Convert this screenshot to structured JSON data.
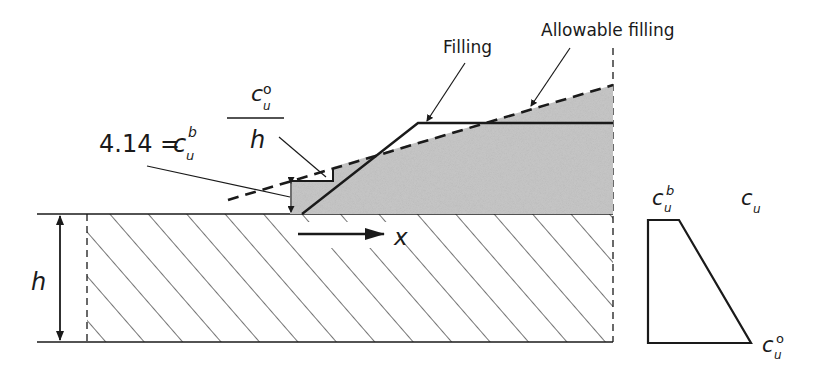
{
  "labels": {
    "filling": "Filling",
    "allowable_filling": "Allowable filling",
    "cub_eq_prefix": "4.14 = ",
    "c": "c",
    "sub_u": "u",
    "sup_b": "b",
    "sup_o": "o",
    "h": "h",
    "x": "x",
    "cu_axis": "c",
    "cu_axis_sub": "u"
  },
  "colors": {
    "line": "#1a1a1a",
    "fill_gray": "#c8c8c8",
    "hatch": "#2a2a2a",
    "background": "#ffffff"
  },
  "geometry": {
    "ground_y": 214,
    "base_y": 342,
    "left_x": 87,
    "right_x": 613,
    "allowable_line": {
      "x1": 228,
      "y1": 200,
      "x2": 613,
      "y2": 85
    },
    "filling_line": [
      [
        302,
        214
      ],
      [
        418,
        123
      ],
      [
        613,
        123
      ]
    ],
    "strength_profile": [
      [
        648,
        220
      ],
      [
        679,
        220
      ],
      [
        751,
        343
      ],
      [
        648,
        343
      ]
    ]
  }
}
